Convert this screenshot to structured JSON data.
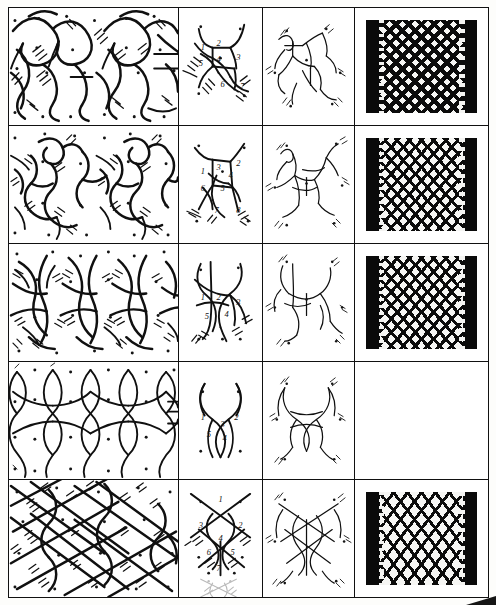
{
  "page": {
    "kind": "scanned-plate",
    "background_color": "#ffffff",
    "ink_color": "#101010",
    "border_color": "#111111",
    "corner_mark": "black-triangle-bottom-right"
  },
  "columns": [
    {
      "id": "pattern",
      "name": "repeat-pattern-diagram"
    },
    {
      "id": "unit",
      "name": "numbered-unit-cell-diagram"
    },
    {
      "id": "braid",
      "name": "thread-path-braid-diagram"
    },
    {
      "id": "photo",
      "name": "lace-sample-photograph"
    }
  ],
  "rows": [
    {
      "id": "row-1",
      "unit_numbers": [
        "1",
        "2",
        "3",
        "5",
        "4",
        "6",
        "7"
      ],
      "has_photo": true,
      "photo_style": "dense",
      "pattern_style": "loop-and-cross",
      "faint_overlay": false
    },
    {
      "id": "row-2",
      "unit_numbers": [
        "1",
        "3",
        "2",
        "4",
        "6",
        "5",
        "7",
        "8"
      ],
      "has_photo": true,
      "photo_style": "diamond",
      "pattern_style": "rosette-grid",
      "faint_overlay": false
    },
    {
      "id": "row-3",
      "unit_numbers": [
        "1",
        "2",
        "3",
        "5",
        "4"
      ],
      "has_photo": true,
      "photo_style": "diamond",
      "pattern_style": "wavy-lattice",
      "faint_overlay": false
    },
    {
      "id": "row-4",
      "unit_numbers": [
        "1",
        "2",
        "3",
        "5",
        "4"
      ],
      "has_photo": false,
      "photo_style": "",
      "pattern_style": "plain-torchon-net",
      "faint_overlay": false
    },
    {
      "id": "row-5",
      "unit_numbers": [
        "1",
        "3",
        "2",
        "4",
        "6",
        "5",
        "7"
      ],
      "has_photo": true,
      "photo_style": "wide",
      "pattern_style": "crossed-diagonal-net",
      "faint_overlay": true
    }
  ]
}
